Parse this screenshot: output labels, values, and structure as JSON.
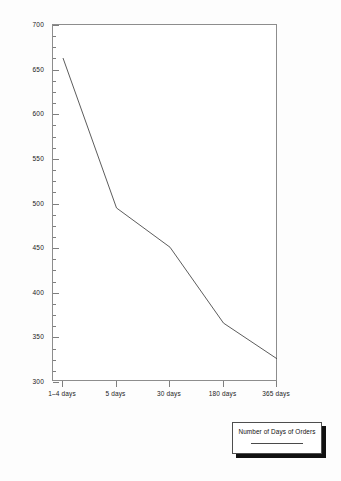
{
  "chart_data": {
    "type": "line",
    "title": "",
    "xlabel": "",
    "ylabel": "",
    "categories": [
      "1–4 days",
      "5 days",
      "30 days",
      "180 days",
      "365 days"
    ],
    "series": [
      {
        "name": "Number of Days of Orders",
        "values": [
          663,
          495,
          451,
          366,
          326
        ]
      }
    ],
    "ylim": [
      300,
      700
    ],
    "ytick_values": [
      300,
      350,
      400,
      450,
      500,
      550,
      600,
      650,
      700
    ],
    "ytick_labels": [
      "300",
      "350",
      "400",
      "450",
      "500",
      "550",
      "600",
      "650",
      "700"
    ],
    "yminor_step": 12.5,
    "grid": false,
    "legend_position": "below-right",
    "line_color": "#4a4a4a",
    "axis_color": "#8d8d8d",
    "background_color": "#ffffff"
  },
  "legend": {
    "label": "Number of Days of Orders"
  }
}
